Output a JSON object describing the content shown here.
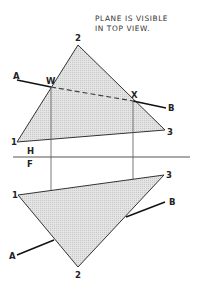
{
  "note": {
    "line1": "PLANE IS VISIBLE",
    "line2": "IN TOP VIEW."
  },
  "fold_line": {
    "upper_label": "H",
    "lower_label": "F"
  },
  "top_view": {
    "vertices": [
      {
        "label": "1",
        "x": 17,
        "y": 142
      },
      {
        "label": "2",
        "x": 78,
        "y": 45
      },
      {
        "label": "3",
        "x": 165,
        "y": 130
      }
    ],
    "line_AB": {
      "start_label": "A",
      "end_label": "B"
    },
    "piercing_points": [
      {
        "label": "W",
        "x": 51,
        "y": 87
      },
      {
        "label": "X",
        "x": 133,
        "y": 101
      }
    ]
  },
  "front_view": {
    "vertices": [
      {
        "label": "1",
        "x": 18,
        "y": 195
      },
      {
        "label": "2",
        "x": 78,
        "y": 267
      },
      {
        "label": "3",
        "x": 164,
        "y": 175
      }
    ],
    "line_AB": {
      "start_label": "A",
      "end_label": "B"
    }
  },
  "colors": {
    "fill": "#d9d9d9",
    "stroke": "#222222"
  }
}
